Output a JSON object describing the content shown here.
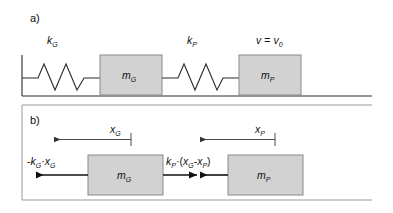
{
  "figure": {
    "panels": [
      {
        "id": "a",
        "label": "a)",
        "spring_left_label": {
          "sym": "k",
          "sub": "G"
        },
        "spring_right_label": {
          "sym": "k",
          "sub": "P"
        },
        "velocity_label": {
          "sym": "v",
          "eq": "=",
          "sym2": "v",
          "sub2": "0"
        },
        "blocks": [
          {
            "sym": "m",
            "sub": "G"
          },
          {
            "sym": "m",
            "sub": "P"
          }
        ]
      },
      {
        "id": "b",
        "label": "b)",
        "displacements": [
          {
            "sym": "x",
            "sub": "G"
          },
          {
            "sym": "x",
            "sub": "P"
          }
        ],
        "forces": [
          {
            "name": "spring-G-force",
            "parts": [
              {
                "t": "-",
                "style": "op"
              },
              {
                "t": "k",
                "style": "var"
              },
              {
                "t": "G",
                "style": "sub"
              },
              {
                "t": "·",
                "style": "op"
              },
              {
                "t": "x",
                "style": "var"
              },
              {
                "t": "G",
                "style": "sub"
              }
            ]
          },
          {
            "name": "spring-P-force",
            "parts": [
              {
                "t": "k",
                "style": "var"
              },
              {
                "t": "P",
                "style": "sub"
              },
              {
                "t": "·(",
                "style": "op"
              },
              {
                "t": "x",
                "style": "var"
              },
              {
                "t": "G",
                "style": "sub"
              },
              {
                "t": "-",
                "style": "op"
              },
              {
                "t": "x",
                "style": "var"
              },
              {
                "t": "P",
                "style": "sub"
              },
              {
                "t": ")",
                "style": "op"
              }
            ]
          }
        ],
        "blocks": [
          {
            "sym": "m",
            "sub": "G"
          },
          {
            "sym": "m",
            "sub": "P"
          }
        ]
      }
    ],
    "colors": {
      "block_fill": "#d2d2d2",
      "block_stroke": "#8a8a8a",
      "line": "#2b2b2b",
      "divider": "#9a9a9a",
      "text": "#111111"
    }
  }
}
